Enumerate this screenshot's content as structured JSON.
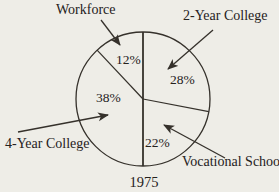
{
  "chart_data": {
    "type": "pie",
    "title": "",
    "caption": "1975",
    "units": "percent",
    "direction": "clockwise",
    "start_angle_deg_from_top": 0,
    "style": "unfilled outline pie with external callout-arrow labels",
    "slices": [
      {
        "label": "2-Year College",
        "value": 28,
        "pct_label": "28%"
      },
      {
        "label": "Vocational School",
        "value": 22,
        "pct_label": "22%"
      },
      {
        "label": "4-Year College",
        "value": 38,
        "pct_label": "38%"
      },
      {
        "label": "Workforce",
        "value": 12,
        "pct_label": "12%"
      }
    ]
  },
  "colors": {
    "background": "#eeede7",
    "line": "#35312b",
    "text": "#25211c"
  }
}
